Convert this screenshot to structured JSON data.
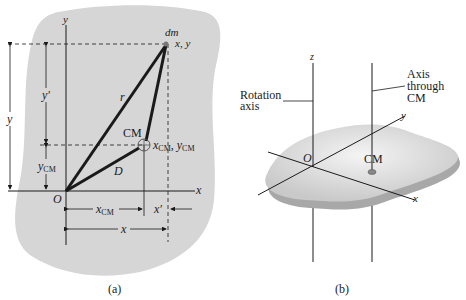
{
  "figure_a": {
    "caption": "(a)",
    "labels": {
      "y_axis": "y",
      "x_axis": "x",
      "origin": "O",
      "dm": "dm",
      "dm_coords": "x, y",
      "r": "r",
      "cm": "CM",
      "cm_coords_x": "x",
      "cm_coords_sub": "CM",
      "cm_coords_y": "y",
      "D": "D",
      "y_dim": "y",
      "y_prime": "y′",
      "y_cm": "y",
      "y_cm_sub": "CM",
      "x_cm": "x",
      "x_cm_sub": "CM",
      "x_prime": "x′",
      "x_dim": "x"
    }
  },
  "figure_b": {
    "caption": "(b)",
    "labels": {
      "z_axis": "z",
      "rotation_axis_1": "Rotation",
      "rotation_axis_2": "axis",
      "cm_axis_1": "Axis",
      "cm_axis_2": "through",
      "cm_axis_3": "CM",
      "y_axis": "y",
      "x_axis": "x",
      "origin": "O",
      "cm": "CM"
    }
  },
  "colors": {
    "blob": "#d6d6d6",
    "plate_top": "#e2e2e2",
    "plate_edge": "#a8a8a8",
    "line": "#1a1a1a"
  }
}
